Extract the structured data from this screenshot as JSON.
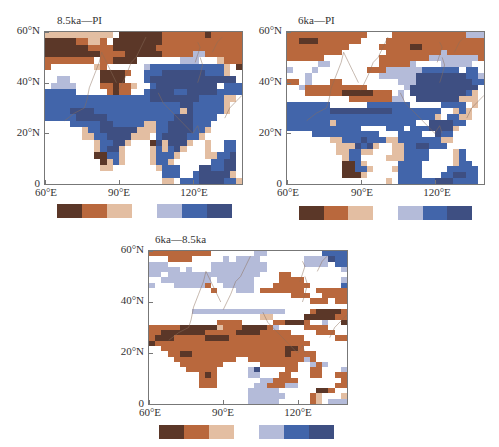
{
  "figure": {
    "panels": [
      {
        "title": "8.5ka—PI",
        "y_ticks": [
          "60°N",
          "40°N",
          "20°N",
          "0"
        ],
        "x_ticks": [
          "60°E",
          "90°E",
          "120°E"
        ],
        "grid": [
          "TTTTTTTTTTT.DDDDDDDBBBBBBBDBBBBB",
          "DDDDDBBTTB.DDDDDDDDBBBBBBBBBBBBB",
          "DDDDDDDBBBBDDDDDDDBBBBBBBBBBBBBB",
          "DDDDDDDDDBBBBDDDDDDBBBBBLLBBBBBB",
          "BBBBBBBB.BBDDDD.......LLL...TBBB",
          "B.......TB......LUUUUUUUUUUUUT.D",
          ".........DDDDB..UUUNNNNNNNUUUT..",
          "..LL.....DDDD...UNNNNNNNNNNNNNN.",
          ".LLLL....BBDBBT..UNNNNNNNNNN.UUU",
          "UUUUU.....BDBB..UNNNNUUNNNNNUUUU",
          "UUUUUUUUUUUUUUUUUNNNNNNNNUUUUTT.",
          "UUUUUUUUUUUUUUUUUUUUUUNNUUUUUT..",
          "UUUUNNNNUUUUUUUUUUUUUUTNUUUUUT..",
          "UUUUUNNNNNUUUUUUUUUUUNNNUUUU....",
          "....UUUUUNNUUUUUTTUUNNNNUUU.....",
          "......TUUNNNNNNTTTUUNNNNUUT.....",
          "......TTUUNNNNTTT.UNNNNUUT......",
          "........TUUNNT...DNTNNNT..T..UU.",
          "........TUNNT....TUTUNT...T..UU.",
          "........DDUUT....TUUUT....TTUUN.",
          ".........DTUT....TUUT......UUNN.",
          ".........TT.......TUUU...NNUUNN.",
          "...................UUU..UNNNNNT.",
          "...................TT.UUUNNNNUUT"
        ]
      },
      {
        "title": "6ka—PI",
        "y_ticks": [
          "60°N",
          "40°N",
          "20°N",
          "0"
        ],
        "x_ticks": [
          "60°E",
          "90°E",
          "120°E"
        ],
        "grid": [
          "BBBBBBBBBBBBB....BBBBBBBBBBBBLLL",
          "BBDDDBBBBBBB....BBBBBBBBBBBBBBBB",
          "BBBBBBBBBB.....BBBBBDDBBBBBBBBBB",
          "BBBBBBBBB.......BBBBBBBBBLBBBBBB",
          "BBBBBB.........BBBBBBBBLLLLLLLLB",
          ".....LL........BBBBBL....LLLLL..",
          "L...L........BBBLLLLLLUUUUUU.UU.",
          "...L...........LLLLLLNNNNNNNNUUL",
          "BB.L...BB.........LLLNNNNNNNNNUU",
          "..LBBBBBBBBBB......LNNNNNNNNNNN.",
          "...BBBBBBDDDDDBBB.L.NNNNNNNNNUT.",
          "..........BBBBBBBLL..NNNNNNNTTT.",
          "UUUUUUU......UUUUUUU.....UUUU.T.",
          "UUUUUUUNNNNNNNNNNUUUUUUUU..TUT..",
          "UUUUUUUUUUUUUUUUUUUUUUUUT.UUTT..",
          "UUUUUUUTUUUUUUUUUUUUU..NNNNUU...",
          "UUUUUUUUUUUU....UUU.UUUNNNNT....",
          "....UUUUUUUUUUU...UUUU..NUU.....",
          ".......TTUUUNUUUTTUUUUUUUTT......",
          "........TTTNUNT..TTUUNNUUU......",
          "........TTUUTT...TTUUUU....TU...",
          ".........TUU....TTTUUUU....TU...",
          ".........DDUT.....UUUU.....TUU..",
          ".........DDUUT...TUUUU....UUUUU.",
          ".........DDDT.....UUUU...UUNNUU.",
          "................T.UUUUUUNNNUUUU."
        ]
      },
      {
        "title": "6ka—8.5ka",
        "y_ticks": [
          "60°N",
          "40°N",
          "20°N",
          "0"
        ],
        "x_ticks": [
          "60°E",
          "90°E",
          "120°E"
        ],
        "grid": [
          "BBBBBBBBBB.......LL.........UUUUL",
          "...BBBB.....L.LLLL.......LLLLNUUL",
          "LLL.......LLLLLLLLL......LLLL.UU.",
          "LLLLL.L...LLLLLLLLL............L",
          "LL.LLLLLLLLLLLLLLL...BB.........",
          "..LLLLLLLL.LLLLLL....BBBB......LL",
          "L...LLLLLB..LLLLL...BBBBBB.....UL",
          "..........B...LLL.BBBBBBB..BBBBB.",
          ".......................BBB..BBBBBBBB",
          "..........................BBB.BBBBB",
          ".................................",
          ".......LLLLLLLLLLLLLLL....BDDDDBU....",
          "..................TT.....DDDDDBBLL...",
          "...........BBBB.....BBDDDB..L..DDDBUL...",
          "BBBBBDDDDDDTBBBDDDDBL....BBBB...BBT..",
          "BBDDDDDDDBBBBBDDDDBBBBB....BBB..BBBBB.",
          "BDDDBBBBBDDDDBBBBBBBBBBBB.....BB.......",
          "DBBBBBBBBBBBBBBBBBBBBBBBBB......",
          "..BBBBBBBBBBBBBBBBBBBBDDB...........",
          "...BBDDBBBBBBBBBBBBBBBDBBBB........",
          "....BBBBBBBBBB..BBBBBBBBBLB.........",
          ".....BBBBBBB......BBBBBB..LBL......",
          "......BBBBB.....LN....BB..BB...L....",
          "........BDB.....LL...BB...BB..BBLB..",
          "........BBB.......LLBBBB.......BBDD..",
          "........BBB......LLBBBLL......BBBDD.",
          "................LLLLL......DDB..B...",
          "................LLLLLL....BT...T.....",
          "................LLLLL.....BT.LLLL...."
        ]
      }
    ]
  },
  "colorbar": {
    "colors": [
      "#5b3728",
      "#b9683d",
      "#e3bea2",
      "#ffffff",
      "#b4bbd9",
      "#4265aa",
      "#3e4f82"
    ],
    "labels": []
  },
  "chart_data": [
    {
      "type": "heatmap",
      "title": "8.5ka—PI",
      "xlabel": "Longitude",
      "ylabel": "Latitude",
      "x_ticks": [
        "60°E",
        "90°E",
        "120°E"
      ],
      "y_ticks": [
        "0",
        "20°N",
        "40°N",
        "60°N"
      ],
      "xlim": [
        60,
        140
      ],
      "ylim": [
        0,
        60
      ],
      "color_classes": 7,
      "legend": "7-class diverging colorbar, brown (negative) to blue (positive); no numeric labels shown",
      "summary": "Northern belt (45-60N) brown/dark brown; central Asia 20-45N mostly blue/navy; India and Indochina mixed blue/tan"
    },
    {
      "type": "heatmap",
      "title": "6ka—PI",
      "xlabel": "Longitude",
      "ylabel": "Latitude",
      "x_ticks": [
        "60°E",
        "90°E",
        "120°E"
      ],
      "y_ticks": [
        "0",
        "20°N",
        "40°N",
        "60°N"
      ],
      "xlim": [
        60,
        140
      ],
      "ylim": [
        0,
        60
      ],
      "color_classes": 7,
      "legend": "7-class diverging colorbar, brown to blue; no numeric labels shown",
      "summary": "Northern belt brown; northeast China navy; 20-35N belt blue; southern India dark brown spot"
    },
    {
      "type": "heatmap",
      "title": "6ka—8.5ka",
      "xlabel": "Longitude",
      "ylabel": "Latitude",
      "x_ticks": [
        "60°E",
        "90°E",
        "120°E"
      ],
      "y_ticks": [
        "0",
        "20°N",
        "40°N",
        "60°N"
      ],
      "xlim": [
        60,
        140
      ],
      "ylim": [
        0,
        60
      ],
      "color_classes": 7,
      "legend": "7-class diverging colorbar, brown to blue; no numeric labels shown",
      "summary": "Northern belt light blue; 20-35N broad brown/dark brown over Iran-India-Tibet; NE China brown with dark brown core"
    }
  ]
}
